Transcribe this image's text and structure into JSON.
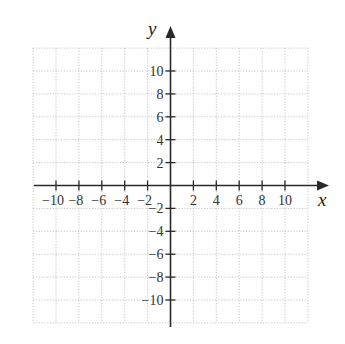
{
  "diagram": {
    "type": "coordinate-plane",
    "x_axis_label": "x",
    "y_axis_label": "y",
    "x_range": [
      -12,
      12
    ],
    "y_range": [
      -12,
      12
    ],
    "grid_step": 2,
    "x_tick_labels": [
      "−10",
      "−8",
      "−6",
      "−4",
      "−2",
      "2",
      "4",
      "6",
      "8",
      "10"
    ],
    "x_tick_values": [
      -10,
      -8,
      -6,
      -4,
      -2,
      2,
      4,
      6,
      8,
      10
    ],
    "y_tick_labels": [
      "10",
      "8",
      "6",
      "4",
      "2",
      "−2",
      "−4",
      "−6",
      "−8",
      "−10"
    ],
    "y_tick_values": [
      10,
      8,
      6,
      4,
      2,
      -2,
      -4,
      -6,
      -8,
      -10
    ],
    "colors": {
      "axis": "#2a2a2a",
      "grid": "#b8b8b8",
      "text": "#333333"
    }
  }
}
